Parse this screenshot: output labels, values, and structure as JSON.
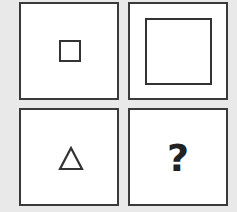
{
  "puzzle": {
    "type": "2x2 analogy matrix",
    "panels": [
      {
        "position": "top-left",
        "content": "small-square",
        "shape": "square",
        "size": "small"
      },
      {
        "position": "top-right",
        "content": "large-square",
        "shape": "square",
        "size": "large"
      },
      {
        "position": "bottom-left",
        "content": "small-triangle",
        "shape": "triangle",
        "size": "small"
      },
      {
        "position": "bottom-right",
        "content": "question-mark",
        "label": "?"
      }
    ],
    "colors": {
      "background": "#e9e9e9",
      "panel": "#ffffff",
      "stroke": "#333333"
    }
  }
}
